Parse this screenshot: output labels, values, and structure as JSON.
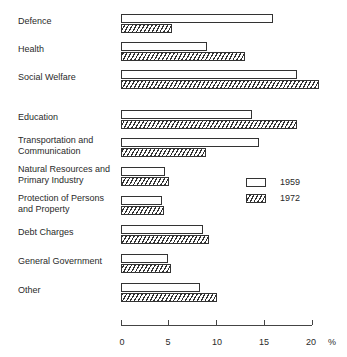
{
  "chart_data": {
    "type": "bar",
    "orientation": "horizontal",
    "title": "",
    "xlabel": "%",
    "ylabel": "",
    "xlim": [
      0,
      20
    ],
    "x_ticks": [
      "0",
      "5",
      "10",
      "15",
      "20"
    ],
    "unit": "%",
    "grid": false,
    "legend_position": "right-middle",
    "categories": [
      "Defence",
      "Health",
      "Social Welfare",
      "Education",
      "Transportation and\nCommunication",
      "Natural Resources and\nPrimary Industry",
      "Protection of Persons\nand Property",
      "Debt Charges",
      "General Government",
      "Other"
    ],
    "series": [
      {
        "name": "1959",
        "pattern": "open",
        "values": [
          15.9,
          9.0,
          18.4,
          13.7,
          14.4,
          4.6,
          4.3,
          8.6,
          4.9,
          8.3
        ]
      },
      {
        "name": "1972",
        "pattern": "hatched",
        "values": [
          5.3,
          13.0,
          20.7,
          18.4,
          8.9,
          5.0,
          4.5,
          9.2,
          5.2,
          10.0
        ]
      }
    ]
  },
  "legend": {
    "items": [
      {
        "label": "1959"
      },
      {
        "label": "1972"
      }
    ]
  }
}
